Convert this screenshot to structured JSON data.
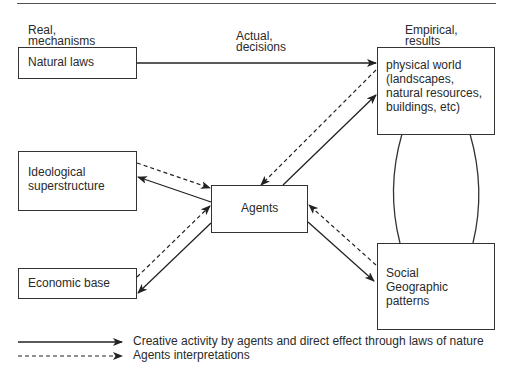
{
  "column_labels": {
    "real": "Real,\nmechanisms",
    "actual": "Actual,\ndecisions",
    "empirical": "Empirical,\nresults"
  },
  "boxes": {
    "natural_laws": "Natural laws",
    "ideological": "Ideological\nsuperstructure",
    "economic": "Economic base",
    "agents": "Agents",
    "physical_world": "physical world\n(landscapes,\nnatural resources,\nbuildings, etc)",
    "social": "Social\nGeographic\npatterns"
  },
  "legend": {
    "solid": "Creative activity by agents and direct effect through laws of nature",
    "dashed": "Agents interpretations"
  },
  "colors": {
    "line": "#333333",
    "text": "#2a2a2a",
    "background": "#ffffff"
  }
}
